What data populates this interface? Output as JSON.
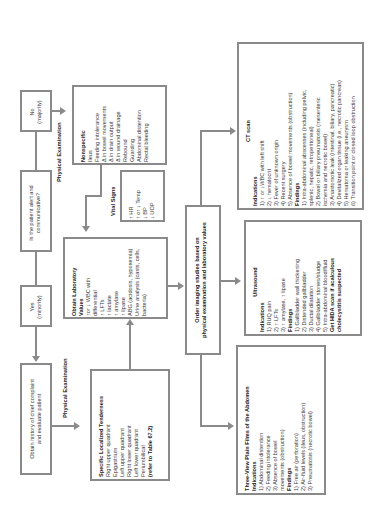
{
  "question": "Is the patient alert and communicative?",
  "no_branch": {
    "line1": "No",
    "line2": "(majority)"
  },
  "yes_branch": {
    "line1": "Yes",
    "line2": "(minority)"
  },
  "history": {
    "line1": "Obtain history of chief complaint",
    "line2": "and evaluate patient"
  },
  "physical_exam_label_top": "Physical Examination",
  "physical_exam_label_bottom": "Physical Examination",
  "nonspecific": {
    "title": "Nonspecific",
    "items": [
      "Ileus",
      "Feeding intolerance",
      "Δ in bowel movements",
      "Δ in drain output",
      "Δ in wound drainage",
      "Rebound",
      "Guarding",
      "Abdominal distention",
      "Rectal bleeding"
    ]
  },
  "vital_signs": {
    "label": "Vital Signs",
    "items": [
      "↑ HR",
      "↑ or ↓ Temp",
      "↓ BP",
      "↓ UOP"
    ]
  },
  "localized": {
    "title": "Specific Localized Tenderness",
    "items": [
      "Right upper quadrant",
      "Epigastrium",
      "Left upper quadrant",
      "Right lower quadrant",
      "Left lower quadrant",
      "Periumbilical"
    ],
    "ref": "(refer to Table 67.2)"
  },
  "labs": {
    "title1": "Obtain Laboratory",
    "title2": "Values",
    "items": [
      "↑or ↓ WBC with",
      "differential",
      "↑ LFTs",
      "↑ lactate",
      "↑ amylase",
      "↑ lipase",
      "ABG (acidosis, hypoxemia)",
      "Urine analysis (casts, cells,",
      "bacteria)"
    ]
  },
  "imaging": {
    "line1": "Order imaging studies based on",
    "line2": "physical examination and laboratory values"
  },
  "ct": {
    "title": "CT scan",
    "indications_label": "Indications",
    "indications": [
      "1)  ↑ or ↓WBC with left shift",
      "2)  ↓ hematocrit",
      "3)  Fever of unknown origin",
      "4)  Recent surgery",
      "5)  Absence of bowel movements (obstruction)"
    ],
    "findings_label": "Findings",
    "findings": [
      "1)  Intra-abdominal abscesses (including pelvic,",
      "     splenic, hepatic, retroperitoneal)",
      "2)  Bowel or biliary pneumatosis (mesenteric",
      "     ischemia and necrotic bowel)",
      "3)  Anastomotic leak (intestinal, biliary, pancreatic)",
      "4)  Devitalized organ tissue (i.e., necrotic pancreas)",
      "5)  Hematoma or leaking aneurysm",
      "6)  Transition point or closed loop obstruction"
    ]
  },
  "ultrasound": {
    "title": "Ultrasound",
    "indications_label": "Indications",
    "indications": [
      "1)  RUQ pain",
      "2)  ↑ LFTs",
      "3)  ↑ amylase, ↑ lipase"
    ],
    "findings_label": "Findings",
    "findings": [
      "1)  Gallbladder wall thickening",
      "2)  Distended gallbladder",
      "3)  Ductal dilatation",
      "4)  Gallbladder stones/sludge",
      "5)  Intra-abdominal blood/fluid"
    ],
    "note1": "Get HIDA scan if acalculous",
    "note2": "cholecystitis suspected"
  },
  "plain_films": {
    "title": "Three-View Plain Films of the Abdomen",
    "indications_label": "Indications",
    "indications": [
      "1)  Abdominal distention",
      "2)  Feeding intolerance",
      "3)  Absence of bowel",
      "     movements (obstruction)"
    ],
    "findings_label": "Findings",
    "findings": [
      "1)  Free air (perforation)",
      "2)  Air-fluid levels (ileus, obstruction)",
      "3)  Pneumatosis (necrotic bowel)"
    ]
  },
  "colors": {
    "border": "#8a8a8a",
    "text": "#333333"
  }
}
